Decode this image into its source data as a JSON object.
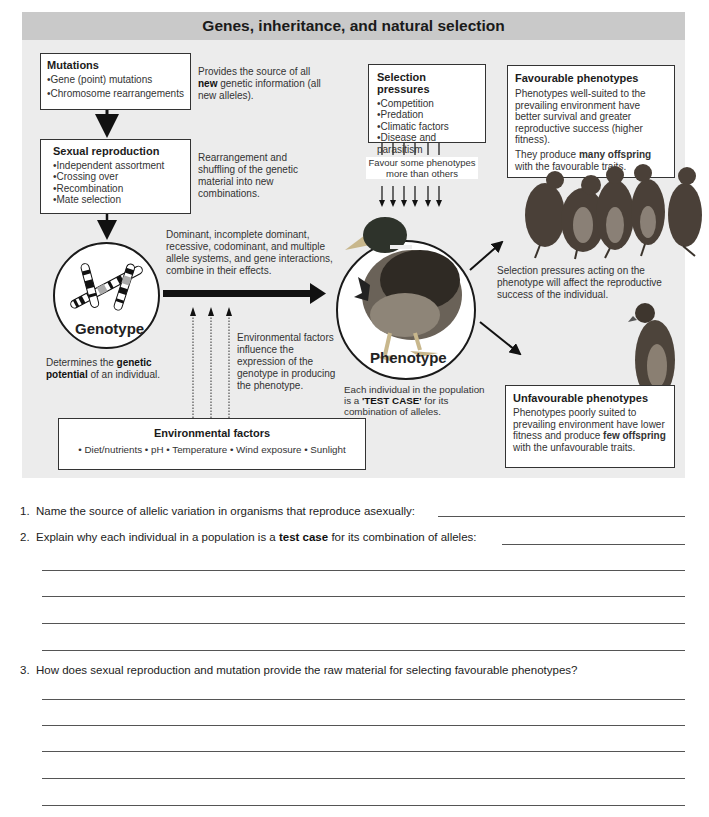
{
  "title": "Genes, inheritance, and natural selection",
  "mutations": {
    "heading": "Mutations",
    "items": [
      "Gene (point) mutations",
      "Chromosome rearrangements"
    ],
    "note_pre": "Provides the source of all",
    "note_bold": "new",
    "note_post": "genetic information (all new alleles)."
  },
  "sexual_reproduction": {
    "heading": "Sexual reproduction",
    "items": [
      "Independent assortment",
      "Crossing over",
      "Recombination",
      "Mate selection"
    ],
    "note": "Rearrangement and shuffling of the genetic material into new combinations."
  },
  "selection_pressures": {
    "heading": "Selection pressures",
    "items": [
      "Competition",
      "Predation",
      "Climatic factors",
      "Disease and parasitism"
    ],
    "favour_note": "Favour some phenotypes more than others"
  },
  "favourable": {
    "heading": "Favourable phenotypes",
    "text": "Phenotypes well-suited to the prevailing environment have better survival and greater reproductive success (higher fitness).",
    "text2_pre": "They produce",
    "text2_bold": "many offspring",
    "text2_post": "with the favourable traits."
  },
  "genotype": {
    "label": "Genotype",
    "note_pre": "Determines the",
    "note_bold": "genetic potential",
    "note_post": "of an individual."
  },
  "interaction_note": "Dominant, incomplete dominant, recessive, codominant, and multiple allele systems, and gene interactions, combine in their effects.",
  "environment_note": "Environmental factors influence the expression of the genotype in producing the phenotype.",
  "phenotype": {
    "label": "Phenotype",
    "note_pre": "Each individual in the population is a",
    "note_bold": "'TEST CASE'",
    "note_post": "for its combination of alleles."
  },
  "selection_note": "Selection pressures acting on the phenotype will affect the reproductive success of the individual.",
  "unfavourable": {
    "heading": "Unfavourable phenotypes",
    "text_pre": "Phenotypes poorly suited to prevailing environment have lower fitness and produce",
    "text_bold": "few offspring",
    "text_post": "with the unfavourable traits."
  },
  "environmental_factors": {
    "heading": "Environmental factors",
    "items": "• Diet/nutrients • pH • Temperature • Wind exposure • Sunlight"
  },
  "questions": [
    {
      "number": "1.",
      "text": "Name the source of allelic variation in organisms that reproduce asexually:"
    },
    {
      "number": "2.",
      "text_pre": "Explain why each individual in a population is a",
      "text_bold": "test case",
      "text_post": "for its combination of alleles:"
    },
    {
      "number": "3.",
      "text": "How does sexual reproduction and mutation provide the raw material for selecting favourable phenotypes?"
    }
  ],
  "colors": {
    "panel": "#ececec",
    "title_bar": "#c9c9c9",
    "ink": "#1a1a1a"
  }
}
